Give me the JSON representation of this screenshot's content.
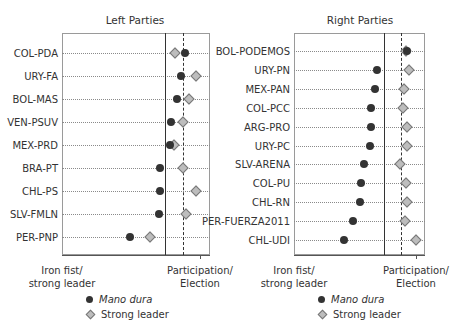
{
  "chart_data": [
    {
      "type": "scatter",
      "title": "Left Parties",
      "xlabel_left": "Iron fist/\nstrong leader",
      "xlabel_right": "Participation/\nElection",
      "xlim": [
        0,
        1
      ],
      "reference_lines": {
        "solid": 0.746,
        "dashed": 0.877
      },
      "legend": [
        "Mano dura",
        "Strong leader"
      ],
      "categories": [
        "COL-PDA",
        "URY-FA",
        "BOL-MAS",
        "VEN-PSUV",
        "MEX-PRD",
        "BRA-PT",
        "CHL-PS",
        "SLV-FMLN",
        "PER-PNP"
      ],
      "series": [
        {
          "name": "Mano dura",
          "marker": "dot",
          "values": [
            0.89,
            0.86,
            0.83,
            0.79,
            0.78,
            0.71,
            0.71,
            0.7,
            0.49
          ]
        },
        {
          "name": "Strong leader",
          "marker": "diamond",
          "values": [
            0.82,
            0.97,
            0.92,
            0.88,
            0.81,
            0.88,
            0.97,
            0.9,
            0.64
          ]
        }
      ]
    },
    {
      "type": "scatter",
      "title": "Right Parties",
      "xlabel_left": "Iron fist/\nstrong leader",
      "xlabel_right": "Participation/\nElection",
      "xlim": [
        0,
        1
      ],
      "reference_lines": {
        "solid": 0.738,
        "dashed": 0.877
      },
      "legend": [
        "Mano dura",
        "Strong leader"
      ],
      "categories": [
        "BOL-PODEMOS",
        "URY-PN",
        "MEX-PAN",
        "COL-PCC",
        "ARG-PRO",
        "URY-PC",
        "SLV-ARENA",
        "COL-PU",
        "CHL-RN",
        "PER-FUERZA2011",
        "CHL-UDI"
      ],
      "series": [
        {
          "name": "Mano dura",
          "marker": "dot",
          "values": [
            0.93,
            0.68,
            0.66,
            0.63,
            0.63,
            0.62,
            0.57,
            0.55,
            0.54,
            0.48,
            0.41
          ]
        },
        {
          "name": "Strong leader",
          "marker": "diamond",
          "values": [
            0.92,
            0.94,
            0.9,
            0.89,
            0.93,
            0.93,
            0.87,
            0.92,
            0.93,
            0.91,
            1.0
          ]
        }
      ]
    }
  ],
  "panels": {
    "left": {
      "title": "Left Parties"
    },
    "right": {
      "title": "Right Parties"
    }
  },
  "axis_labels": {
    "left_end_line1": "Iron fist/",
    "left_end_line2": "strong leader",
    "right_end_line1": "Participation/",
    "right_end_line2": "Election"
  },
  "legend": {
    "mano_dura": "Mano dura",
    "strong_leader": "Strong leader"
  }
}
